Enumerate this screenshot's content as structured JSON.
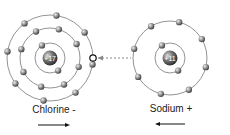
{
  "atoms": [
    {
      "name": "Chlorine -",
      "nucleus": "+17",
      "shells": [
        2,
        8,
        8
      ],
      "arrow": "right"
    },
    {
      "name": "Sodium +",
      "nucleus": "+11",
      "shells": [
        2,
        8
      ],
      "arrow": "left"
    }
  ],
  "transfer": {
    "from": "Sodium",
    "to": "Chlorine",
    "style": "dashed-arrow"
  }
}
